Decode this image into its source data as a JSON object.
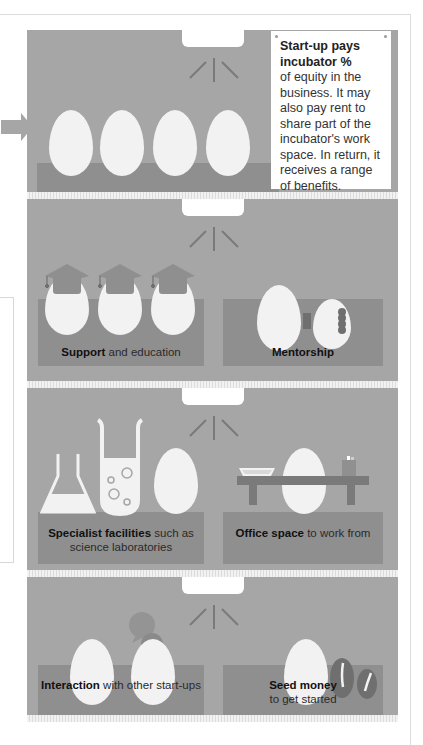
{
  "note": {
    "title": "Start-up pays incubator %",
    "body": "of equity in the business. It may also pay rent to share part of the incubator's work space. In return, it receives a range of benefits."
  },
  "benefits": [
    {
      "bold": "Support",
      "rest": " and education",
      "icon": "graduation-eggs"
    },
    {
      "bold": "Mentorship",
      "rest": "",
      "icon": "connected-eggs"
    },
    {
      "bold": "Specialist facilities",
      "rest": " such as science laboratories",
      "icon": "lab-glassware"
    },
    {
      "bold": "Office space",
      "rest": " to work from",
      "icon": "office-desk"
    },
    {
      "bold": "Interaction",
      "rest": " with other start-ups",
      "icon": "speech-bubbles"
    },
    {
      "bold": "Seed money",
      "rest": " to get started",
      "icon": "seeds"
    }
  ],
  "colors": {
    "panel": "#a6a6a6",
    "shelf": "#8f8f8f",
    "egg": "#f2f2f2",
    "accent_dark": "#7a7a7a"
  }
}
